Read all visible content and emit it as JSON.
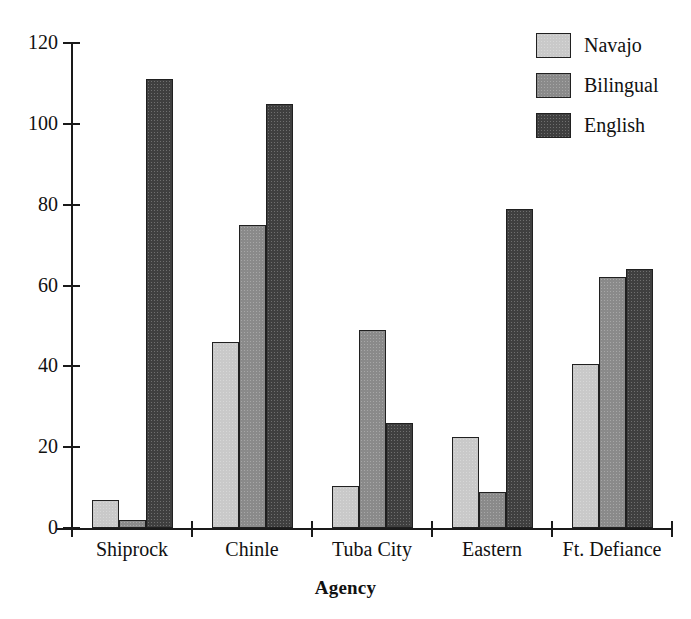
{
  "chart_data": {
    "type": "bar",
    "title": "",
    "xlabel": "Agency",
    "ylabel": "",
    "categories": [
      "Shiprock",
      "Chinle",
      "Tuba City",
      "Eastern",
      "Ft. Defiance"
    ],
    "series": [
      {
        "name": "Navajo",
        "color": "#c9c9c9",
        "values": [
          7,
          46,
          10.5,
          22.5,
          40.5
        ]
      },
      {
        "name": "Bilingual",
        "color": "#8a8a8a",
        "values": [
          2,
          75,
          49,
          9,
          62
        ]
      },
      {
        "name": "English",
        "color": "#3f3f3f",
        "values": [
          111,
          105,
          26,
          79,
          64
        ]
      }
    ],
    "ylim": [
      0,
      120
    ],
    "yticks": [
      0,
      20,
      40,
      60,
      80,
      100,
      120
    ],
    "ytick_labels": [
      "0",
      "20",
      "40",
      "60",
      "80",
      "100",
      "120"
    ],
    "grid": false,
    "legend_position": "top-right"
  }
}
